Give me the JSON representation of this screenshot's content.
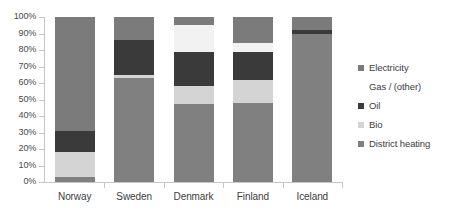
{
  "chart_data": {
    "type": "bar",
    "subtype": "stacked-100-percent",
    "title": "",
    "xlabel": "",
    "ylabel": "",
    "ylim": [
      0,
      100
    ],
    "ytick_labels": [
      "100%",
      "90%",
      "80%",
      "70%",
      "60%",
      "50%",
      "40%",
      "30%",
      "20%",
      "10%",
      "0%"
    ],
    "ytick_values": [
      100,
      90,
      80,
      70,
      60,
      50,
      40,
      30,
      20,
      10,
      0
    ],
    "grid": false,
    "legend_position": "right",
    "categories": [
      "Norway",
      "Sweden",
      "Denmark",
      "Finland",
      "Iceland"
    ],
    "series": [
      {
        "name": "Electricity",
        "color": "#7b7b7b",
        "values": [
          69,
          14,
          5,
          16,
          8
        ]
      },
      {
        "name": "Gas / (other)",
        "color": "#f2f2f2",
        "values": [
          0,
          0,
          16,
          5,
          0
        ]
      },
      {
        "name": "Oil",
        "color": "#3a3a3a",
        "values": [
          13,
          21,
          21,
          17,
          2
        ]
      },
      {
        "name": "Bio",
        "color": "#d4d4d4",
        "values": [
          15,
          2,
          11,
          14,
          0
        ]
      },
      {
        "name": "District heating",
        "color": "#808080",
        "values": [
          3,
          63,
          47,
          48,
          90
        ]
      }
    ],
    "stack_order_bottom_to_top": [
      "District heating",
      "Bio",
      "Oil",
      "Gas / (other)",
      "Electricity"
    ]
  },
  "legend": {
    "items": [
      {
        "label": "Electricity",
        "color": "#7b7b7b",
        "has_swatch": true
      },
      {
        "label": "Gas / (other)",
        "color": "#f2f2f2",
        "has_swatch": false
      },
      {
        "label": "Oil",
        "color": "#3a3a3a",
        "has_swatch": true
      },
      {
        "label": "Bio",
        "color": "#d4d4d4",
        "has_swatch": true
      },
      {
        "label": "District heating",
        "color": "#808080",
        "has_swatch": true
      }
    ]
  },
  "axis": {
    "y_labels": [
      "100%",
      "90%",
      "80%",
      "70%",
      "60%",
      "50%",
      "40%",
      "30%",
      "20%",
      "10%",
      "0%"
    ],
    "x_labels": [
      "Norway",
      "Sweden",
      "Denmark",
      "Finland",
      "Iceland"
    ]
  }
}
